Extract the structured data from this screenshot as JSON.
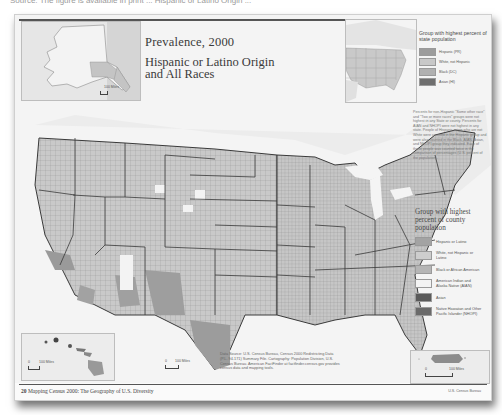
{
  "top_caption": "Source: The figure is available in print ... Hispanic or Latino Origin ...",
  "title": {
    "main": "Prevalence, 2000",
    "subtitle_line1": "Hispanic or Latino Origin",
    "subtitle_line2": "and All Races"
  },
  "state_legend": {
    "heading": "Group with highest percent of state population",
    "items": [
      {
        "label": "Hispanic (PR)",
        "color": "#9c9c9c"
      },
      {
        "label": "White, not Hispanic",
        "color": "#c8c8c8"
      },
      {
        "label": "Black (DC)",
        "color": "#b0b0b0"
      },
      {
        "label": "Asian (HI)",
        "color": "#6e6e6e"
      }
    ]
  },
  "note": "Percents for non-Hispanic \"Some other race\" and \"Two or more races\" groups were not highest in any State or county. Percents for AIAN and NHOPI were not highest in any state. People of Hispanic origin who are not White were counted in the Hispanic group and were also counted in the Black, AIAN, Asian, and NHOPI group they indicated. Each of these people was counted twice in the comparison of percentages (U.S. percent of the population).",
  "county_legend": {
    "heading": "Group with highest percent of county population",
    "items": [
      {
        "label": "Hispanic or Latino",
        "color": "#a3a3a3"
      },
      {
        "label": "White, not Hispanic or Latino",
        "color": "#cdcdcd"
      },
      {
        "label": "Black or African American",
        "color": "#b5b5b5"
      },
      {
        "label": "American Indian and Alaska Native (AIAN)",
        "color": "#f3f3f3"
      },
      {
        "label": "Asian",
        "color": "#5a5a5a"
      },
      {
        "label": "Native Hawaiian and Other Pacific Islander (NHOPI)",
        "color": "#6a6a6a"
      }
    ]
  },
  "source_note": "Data Source: U.S. Census Bureau, Census 2000 Redistricting Data (P.L. 94-171) Summary File. Cartography: Population Division, U.S. Census Bureau. American FactFinder at factfinder.census.gov provides census data and mapping tools.",
  "scales": {
    "alaska": "100 Miles",
    "hawaii": "100 Miles",
    "conus": "100 Miles",
    "puerto_rico": "100 Miles",
    "zero": "0"
  },
  "footer": {
    "page_number": "20",
    "book_title": "Mapping Census 2000: The Geography of U.S. Diversity",
    "publisher": "U.S. Census Bureau"
  },
  "colors": {
    "water": "#f4f4f4",
    "land_base": "#c9c9c9",
    "hispanic": "#a3a3a3",
    "aian": "#f3f3f3",
    "border": "#3a3a3a"
  }
}
